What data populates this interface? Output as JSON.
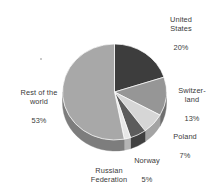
{
  "chart_data": {
    "type": "pie",
    "title": "",
    "subtitle": "",
    "xlabel": "",
    "ylabel": "",
    "legend_position": "none",
    "grid": false,
    "style": "3d-pie-grayscale",
    "start_angle_deg": 0,
    "direction": "clockwise",
    "units": "percent",
    "categories": [
      "United States",
      "Switzerland",
      "Poland",
      "Norway",
      "Russian Federation",
      "Rest of the world"
    ],
    "values": [
      20,
      13,
      7,
      5,
      2,
      53
    ],
    "colors": [
      "#3d3d3d",
      "#969696",
      "#d6d6d6",
      "#5c5c5c",
      "#e8e8e8",
      "#a8a8a8"
    ],
    "side_colors": [
      "#2a2a2a",
      "#6f6f6f",
      "#a4a4a4",
      "#404040",
      "#b4b4b4",
      "#7d7d7d"
    ],
    "slices": [
      {
        "name": "United States",
        "label_lines": [
          "United",
          "States"
        ],
        "value": 20,
        "value_label": "20%",
        "color": "#3d3d3d",
        "side_color": "#2a2a2a"
      },
      {
        "name": "Switzerland",
        "label_lines": [
          "Switzer-",
          "land"
        ],
        "value": 13,
        "value_label": "13%",
        "color": "#969696",
        "side_color": "#6f6f6f"
      },
      {
        "name": "Poland",
        "label_lines": [
          "Poland"
        ],
        "value": 7,
        "value_label": "7%",
        "color": "#d6d6d6",
        "side_color": "#a4a4a4"
      },
      {
        "name": "Norway",
        "label_lines": [
          "Norway"
        ],
        "value": 5,
        "value_label": "5%",
        "color": "#5c5c5c",
        "side_color": "#404040"
      },
      {
        "name": "Russian Federation",
        "label_lines": [
          "Russian",
          "Federation"
        ],
        "value": 2,
        "value_label": "2%",
        "color": "#e8e8e8",
        "side_color": "#b4b4b4"
      },
      {
        "name": "Rest of the world",
        "label_lines": [
          "Rest of the",
          "world"
        ],
        "value": 53,
        "value_label": "53%",
        "color": "#a8a8a8",
        "side_color": "#7d7d7d"
      }
    ]
  },
  "labels": {
    "united_states": {
      "name": "United\nStates",
      "value": "20%"
    },
    "switzerland": {
      "name": "Switzer-\nland",
      "value": "13%"
    },
    "poland": {
      "name": "Poland",
      "value": "7%"
    },
    "norway": {
      "name": "Norway",
      "value": "5%"
    },
    "russia": {
      "name": "Russian\nFederation",
      "value": "2%"
    },
    "rest": {
      "name": "Rest of the\nworld",
      "value": "53%"
    }
  }
}
